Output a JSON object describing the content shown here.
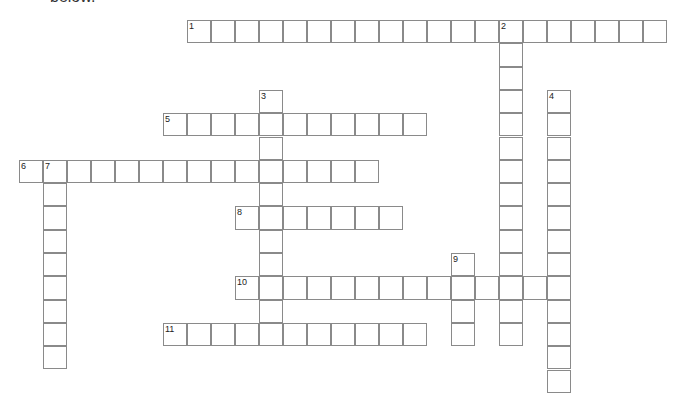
{
  "header": {
    "text": "below."
  },
  "grid": {
    "origin_x": 19,
    "origin_y": 20,
    "cell_w": 24,
    "cell_h": 23.3
  },
  "words": [
    {
      "number": "1",
      "direction": "across",
      "row": 0,
      "col": 7,
      "length": 20
    },
    {
      "number": "2",
      "direction": "down",
      "row": 0,
      "col": 20,
      "length": 14
    },
    {
      "number": "3",
      "direction": "down",
      "row": 3,
      "col": 10,
      "length": 11
    },
    {
      "number": "4",
      "direction": "down",
      "row": 3,
      "col": 22,
      "length": 13
    },
    {
      "number": "5",
      "direction": "across",
      "row": 4,
      "col": 6,
      "length": 11
    },
    {
      "number": "6",
      "direction": "across",
      "row": 6,
      "col": 0,
      "length": 15
    },
    {
      "number": "7",
      "direction": "down",
      "row": 6,
      "col": 1,
      "length": 9
    },
    {
      "number": "8",
      "direction": "across",
      "row": 8,
      "col": 9,
      "length": 7
    },
    {
      "number": "9",
      "direction": "down",
      "row": 10,
      "col": 18,
      "length": 4
    },
    {
      "number": "10",
      "direction": "across",
      "row": 11,
      "col": 9,
      "length": 14
    },
    {
      "number": "11",
      "direction": "across",
      "row": 13,
      "col": 6,
      "length": 11
    }
  ]
}
